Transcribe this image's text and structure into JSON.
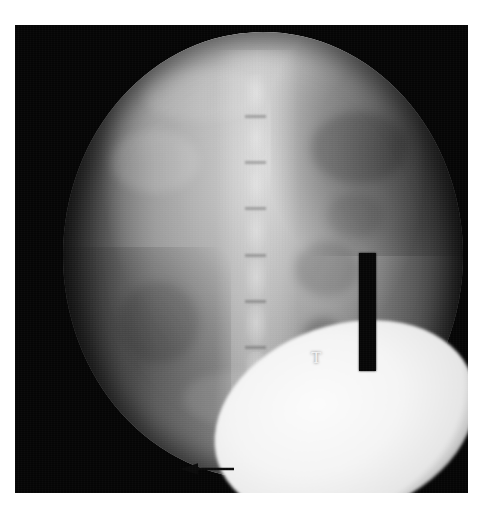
{
  "image": {
    "modality": "fluoroscopy-radiograph",
    "body_region": "lumbar spine / abdomen",
    "projection": "anteroposterior",
    "canvas_width_px": 496,
    "canvas_height_px": 518,
    "page_background_color": "#ffffff"
  },
  "frame": {
    "name": "scan-frame",
    "left_px": 15,
    "top_px": 25,
    "width_px": 453,
    "height_px": 468,
    "background_color": "#050505"
  },
  "fluoro_field": {
    "shape": "circle",
    "center_x_px": 263,
    "center_y_px": 256,
    "width_px": 400,
    "height_px": 447,
    "bright_color": "#d6d6d6",
    "mid_color": "#a6a6a6",
    "dark_color": "#1d1d1d"
  },
  "annotations": [
    {
      "id": "marker-bar",
      "type": "radiopaque-marker-bar",
      "label": "",
      "color": "#060606",
      "left_px": 359,
      "top_px": 253,
      "width_px": 17,
      "height_px": 118
    },
    {
      "id": "t-annotation",
      "type": "text-letter",
      "label": "T",
      "color": "#f2f2f2",
      "left_px": 311,
      "top_px": 349,
      "font_size_px": 17
    },
    {
      "id": "arrow-annotation",
      "type": "arrow",
      "label": "",
      "direction": "left",
      "color": "#0a0a0a",
      "left_px": 180,
      "top_px": 462,
      "width_px": 54,
      "height_px": 14
    }
  ],
  "anatomy": {
    "spine": {
      "name": "lumbar-vertebral-column",
      "orientation": "vertical-midline",
      "vertebrae": [
        {
          "label": "",
          "top_pct": 6,
          "height_pct": 9
        },
        {
          "label": "",
          "top_pct": 17,
          "height_pct": 9
        },
        {
          "label": "",
          "top_pct": 28,
          "height_pct": 9
        },
        {
          "label": "",
          "top_pct": 39,
          "height_pct": 9
        },
        {
          "label": "",
          "top_pct": 50,
          "height_pct": 9
        },
        {
          "label": "",
          "top_pct": 61,
          "height_pct": 9
        },
        {
          "label": "",
          "top_pct": 72,
          "height_pct": 9
        }
      ],
      "disc_lines_top_pct": [
        15.5,
        26.5,
        37.5,
        48.5,
        59.5,
        70.5,
        81.5
      ]
    },
    "bright_structure": {
      "name": "contrast-opacified-structure",
      "color": "#fbfbfb",
      "left_px": 211,
      "top_px": 325,
      "width_px": 268,
      "height_px": 190,
      "rotation_deg": -19
    },
    "soft_tissue_blobs": [
      {
        "left_pct": 12,
        "top_pct": 22,
        "w_pct": 22,
        "h_pct": 14,
        "color": "rgba(255,255,255,0.13)"
      },
      {
        "left_pct": 62,
        "top_pct": 18,
        "w_pct": 24,
        "h_pct": 16,
        "color": "rgba(0,0,0,0.16)"
      },
      {
        "left_pct": 14,
        "top_pct": 56,
        "w_pct": 20,
        "h_pct": 18,
        "color": "rgba(0,0,0,0.12)"
      },
      {
        "left_pct": 58,
        "top_pct": 47,
        "w_pct": 16,
        "h_pct": 12,
        "color": "rgba(0,0,0,0.14)"
      },
      {
        "left_pct": 60,
        "top_pct": 64,
        "w_pct": 10,
        "h_pct": 8,
        "color": "rgba(0,0,0,0.22)"
      },
      {
        "left_pct": 30,
        "top_pct": 76,
        "w_pct": 26,
        "h_pct": 12,
        "color": "rgba(255,255,255,0.10)"
      },
      {
        "left_pct": 20,
        "top_pct": 8,
        "w_pct": 30,
        "h_pct": 12,
        "color": "rgba(255,255,255,0.10)"
      },
      {
        "left_pct": 66,
        "top_pct": 36,
        "w_pct": 14,
        "h_pct": 10,
        "color": "rgba(0,0,0,0.10)"
      }
    ]
  }
}
